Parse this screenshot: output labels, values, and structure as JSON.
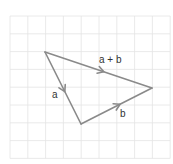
{
  "diagram": {
    "type": "vector-triangle",
    "grid": {
      "origin_x": 10,
      "origin_y": 16,
      "cell": 17.8,
      "cols": 9,
      "rows": 8,
      "line_color": "#e4e4e4"
    },
    "stroke_color": "#8a8a8a",
    "vectors": [
      {
        "name": "a",
        "label": "a",
        "from": [
          45,
          52
        ],
        "to": [
          81,
          124
        ]
      },
      {
        "name": "b",
        "label": "b",
        "from": [
          81,
          124
        ],
        "to": [
          152,
          88
        ]
      },
      {
        "name": "a-plus-b",
        "label": "a + b",
        "from": [
          45,
          52
        ],
        "to": [
          152,
          88
        ]
      }
    ],
    "labels": {
      "a": "a",
      "b": "b",
      "a_plus_b": "a + b"
    }
  }
}
